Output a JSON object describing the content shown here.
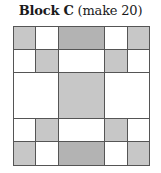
{
  "title": {
    "bold": "Block C",
    "regular": " (make 20)"
  },
  "colors": {
    "light": "#c7c7c7",
    "dark": "#b3b3b3",
    "white": "#ffffff",
    "line": "#555555"
  },
  "grid": {
    "origin": [
      13,
      26
    ],
    "columns": [
      0,
      22,
      45,
      91,
      114,
      136
    ],
    "rows": [
      0,
      23,
      46,
      92,
      115,
      139
    ],
    "cells": [
      {
        "r": 0,
        "c": 0,
        "rs": 1,
        "cs": 1,
        "fill": "light"
      },
      {
        "r": 0,
        "c": 1,
        "rs": 1,
        "cs": 1,
        "fill": "white"
      },
      {
        "r": 0,
        "c": 2,
        "rs": 1,
        "cs": 1,
        "fill": "dark"
      },
      {
        "r": 0,
        "c": 3,
        "rs": 1,
        "cs": 1,
        "fill": "white"
      },
      {
        "r": 0,
        "c": 4,
        "rs": 1,
        "cs": 1,
        "fill": "light"
      },
      {
        "r": 1,
        "c": 0,
        "rs": 1,
        "cs": 1,
        "fill": "white"
      },
      {
        "r": 1,
        "c": 1,
        "rs": 1,
        "cs": 1,
        "fill": "light"
      },
      {
        "r": 1,
        "c": 2,
        "rs": 1,
        "cs": 1,
        "fill": "white"
      },
      {
        "r": 1,
        "c": 3,
        "rs": 1,
        "cs": 1,
        "fill": "light"
      },
      {
        "r": 1,
        "c": 4,
        "rs": 1,
        "cs": 1,
        "fill": "white"
      },
      {
        "r": 2,
        "c": 0,
        "rs": 1,
        "cs": 2,
        "fill": "white"
      },
      {
        "r": 2,
        "c": 2,
        "rs": 1,
        "cs": 1,
        "fill": "light"
      },
      {
        "r": 2,
        "c": 3,
        "rs": 1,
        "cs": 2,
        "fill": "white"
      },
      {
        "r": 3,
        "c": 0,
        "rs": 1,
        "cs": 1,
        "fill": "white"
      },
      {
        "r": 3,
        "c": 1,
        "rs": 1,
        "cs": 1,
        "fill": "light"
      },
      {
        "r": 3,
        "c": 2,
        "rs": 1,
        "cs": 1,
        "fill": "white"
      },
      {
        "r": 3,
        "c": 3,
        "rs": 1,
        "cs": 1,
        "fill": "light"
      },
      {
        "r": 3,
        "c": 4,
        "rs": 1,
        "cs": 1,
        "fill": "white"
      },
      {
        "r": 4,
        "c": 0,
        "rs": 1,
        "cs": 1,
        "fill": "light"
      },
      {
        "r": 4,
        "c": 1,
        "rs": 1,
        "cs": 1,
        "fill": "white"
      },
      {
        "r": 4,
        "c": 2,
        "rs": 1,
        "cs": 1,
        "fill": "dark"
      },
      {
        "r": 4,
        "c": 3,
        "rs": 1,
        "cs": 1,
        "fill": "white"
      },
      {
        "r": 4,
        "c": 4,
        "rs": 1,
        "cs": 1,
        "fill": "light"
      }
    ]
  }
}
